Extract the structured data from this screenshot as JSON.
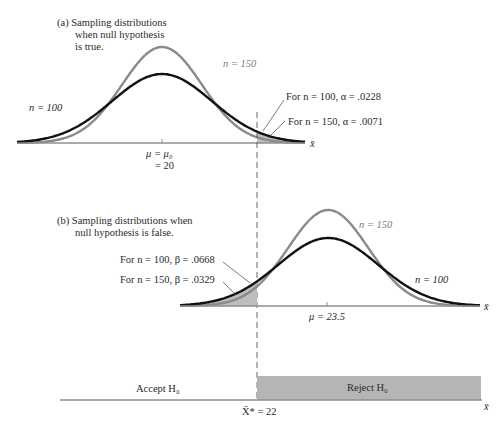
{
  "panel_a": {
    "caption_lines": [
      "(a)  Sampling distributions",
      "when null hypothesis",
      "is true."
    ],
    "label_n150": "n = 150",
    "label_n100": "n = 100",
    "annot_alpha_100": "For n = 100, α = .0228",
    "annot_alpha_150": "For n = 150, α = .0071",
    "mu_label": "μ = μ₀",
    "mu_value": "= 20",
    "axis_label": "x̄"
  },
  "panel_b": {
    "caption_lines": [
      "(b)  Sampling distributions when",
      "null hypothesis is false."
    ],
    "annot_beta_100": "For n = 100, β = .0668",
    "annot_beta_150": "For n = 150, β = .0329",
    "label_n150": "n = 150",
    "label_n100": "n = 100",
    "mu_label": "μ = 23.5",
    "axis_label": "x̄"
  },
  "decision": {
    "accept_label": "Accept H₀",
    "reject_label": "Reject H₀",
    "cutoff_label": "X̄* = 22",
    "axis_label": "x̄"
  },
  "colors": {
    "n100_curve": "#111111",
    "n150_curve": "#8a8a8a",
    "shade": "#bdbdbd",
    "reject_fill": "#b5b5b5",
    "axis": "#8f8f8f"
  },
  "chart_data": {
    "type": "line",
    "xlabel": "x̄",
    "cutoff": 22,
    "null_mean": 20,
    "alt_mean": 23.5,
    "series": [
      {
        "name": "H0 true, n = 100",
        "mean": 20,
        "alpha": 0.0228
      },
      {
        "name": "H0 true, n = 150",
        "mean": 20,
        "alpha": 0.0071
      },
      {
        "name": "H0 false, n = 100",
        "mean": 23.5,
        "beta": 0.0668
      },
      {
        "name": "H0 false, n = 150",
        "mean": 23.5,
        "beta": 0.0329
      }
    ],
    "regions": [
      {
        "name": "Accept H0",
        "x_range": [
          "-inf",
          22
        ]
      },
      {
        "name": "Reject H0",
        "x_range": [
          22,
          "inf"
        ]
      }
    ]
  }
}
